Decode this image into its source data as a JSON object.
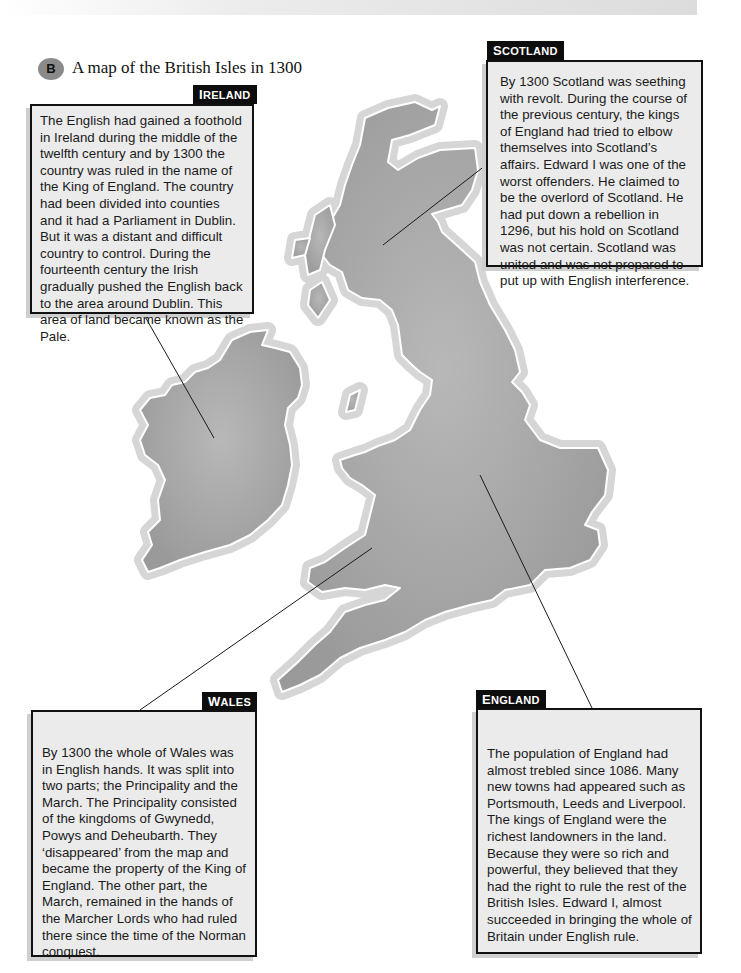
{
  "header": {
    "badge": "B",
    "title": "A map of the British Isles in 1300"
  },
  "regions": {
    "ireland": {
      "label_cap": "I",
      "label_rest": "RELAND",
      "text": "The English had gained a foothold in Ireland during the middle of the twelfth century and by 1300 the country was ruled in the name of the King of England. The country had been divided into counties and it had a Parliament in Dublin. But it was a distant and difficult country to control. During the fourteenth century the Irish gradually pushed the English back to the area around Dublin. This area of land became known as the Pale."
    },
    "scotland": {
      "label_cap": "S",
      "label_rest": "COTLAND",
      "text": "By 1300 Scotland was seething with revolt. During the course of the previous century, the kings of England had tried to elbow themselves into Scotland’s affairs. Edward I was one of the worst offenders. He claimed to be the overlord of Scotland. He had put down a rebellion in 1296, but his hold on Scotland was not certain. Scotland was united and was not prepared to put up with English interference."
    },
    "wales": {
      "label_cap": "W",
      "label_rest": "ALES",
      "text": "By 1300 the whole of Wales was in English hands. It was split into two parts; the Principality and the March. The Principality consisted of the kingdoms of Gwynedd, Powys and Deheubarth. They ‘disappeared’ from the map and became the property of the King of England. The other part, the March, remained in the hands of the Marcher Lords who had ruled there since the time of the Norman conquest."
    },
    "england": {
      "label_cap": "E",
      "label_rest": "NGLAND",
      "text": "The population of England had almost trebled since 1086. Many new towns had appeared such as Portsmouth, Leeds and Liverpool. The kings of England were the richest landowners in the land. Because they were so rich and powerful, they believed that they had the right to rule the rest of the British Isles. Edward I, almost succeeded in bringing the whole of Britain under English rule."
    }
  },
  "colors": {
    "land": "#a9a9a9",
    "halo": "#d6d6d6",
    "box_bg": "#ebebeb",
    "label_bg": "#0d0d0d",
    "badge": "#8a8a8a"
  }
}
